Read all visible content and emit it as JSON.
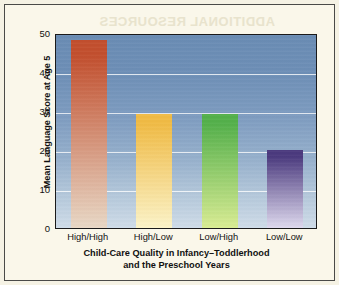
{
  "figure": {
    "background_color": "#faf7ea",
    "border_color": "#4a4a48",
    "ghost_text": "ADDITIONAL RESOURCES"
  },
  "chart_data": {
    "type": "bar",
    "title": "",
    "subtitle": "",
    "categories": [
      "High/High",
      "High/Low",
      "Low/High",
      "Low/Low"
    ],
    "values": [
      48.3,
      29.2,
      29.2,
      20.1
    ],
    "series": [
      {
        "name": "Mean Language Score at Age 5",
        "values": [
          48.3,
          29.2,
          29.2,
          20.1
        ]
      }
    ],
    "xlabel": "Child-Care Quality in Infancy–Toddlerhood and the Preschool Years",
    "xlabel_line1": "Child-Care Quality in Infancy–Toddlerhood",
    "xlabel_line2": "and the Preschool Years",
    "ylabel": "Mean Language Score at Age 5",
    "ylim": [
      0,
      50
    ],
    "yticks": [
      0,
      10,
      20,
      30,
      40,
      50
    ],
    "ytick_labels": [
      "0",
      "10",
      "20",
      "30",
      "40",
      "50"
    ],
    "grid": true,
    "gridline_color": "#ffffff",
    "legend": null,
    "legend_position": "none",
    "plot_background_top_color": "#6a8cb4",
    "plot_background_bottom_color": "#cfdce8",
    "bar_colors_top": [
      "#c24f2e",
      "#f0bb45",
      "#54b04b",
      "#4b3a7e"
    ],
    "bar_colors_bottom": [
      "#e8d8c6",
      "#fbf3c8",
      "#d9ec93",
      "#ded9ee"
    ]
  }
}
